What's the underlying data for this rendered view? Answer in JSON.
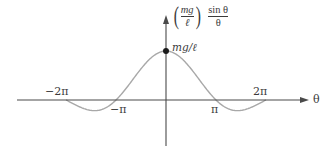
{
  "chart_data": {
    "type": "line",
    "title": "",
    "function": "(mg/ℓ) sin θ / θ",
    "xlabel": "θ",
    "ylabel": "(mg/ℓ) sin θ / θ",
    "ylabel_parts": {
      "coef_num": "mg",
      "coef_den": "ℓ",
      "num": "sin θ",
      "den": "θ"
    },
    "x_ticks": [
      {
        "label": "−2π",
        "value": -6.2832,
        "position": "above"
      },
      {
        "label": "−π",
        "value": -3.1416,
        "position": "below"
      },
      {
        "label": "π",
        "value": 3.1416,
        "position": "below"
      },
      {
        "label": "2π",
        "value": 6.2832,
        "position": "above"
      }
    ],
    "annotations": [
      {
        "label": "mg/ℓ",
        "x": 0,
        "y": 1,
        "marker": "dot"
      }
    ],
    "xlim": [
      -6.2832,
      6.2832
    ],
    "ylim": [
      -0.22,
      1
    ],
    "grid": false,
    "legend": "none",
    "series": [
      {
        "name": "(mg/ℓ) sin θ / θ",
        "x": [
          -6.2832,
          -5.4978,
          -4.7124,
          -3.927,
          -3.1416,
          -2.3562,
          -1.5708,
          -0.7854,
          0,
          0.7854,
          1.5708,
          2.3562,
          3.1416,
          3.927,
          4.7124,
          5.4978,
          6.2832
        ],
        "values": [
          0,
          -0.1286,
          -0.2122,
          -0.1801,
          0,
          0.3001,
          0.6366,
          0.9003,
          1,
          0.9003,
          0.6366,
          0.3001,
          0,
          -0.1801,
          -0.2122,
          -0.1286,
          0
        ]
      }
    ],
    "colors": {
      "axis": "#4a4a4a",
      "curve": "#a8a8a8",
      "marker": "#1a1a1a"
    }
  }
}
